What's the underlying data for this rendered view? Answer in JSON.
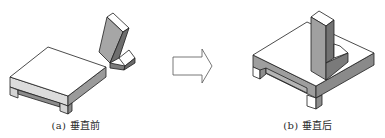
{
  "figure": {
    "panels": [
      {
        "id": "a",
        "caption": "(a) 垂直前",
        "description": "base plate and separate L-bracket before perpendicular constraint"
      },
      {
        "id": "b",
        "caption": "(b) 垂直后",
        "description": "L-bracket standing perpendicular on base plate after constraint"
      }
    ],
    "arrow": {
      "direction": "right",
      "style": "outlined"
    }
  },
  "colors": {
    "stroke": "#1e1e1e",
    "face_top": "#ffffff",
    "face_side_light": "#d9d9d9",
    "face_side_mid": "#a8a8a8",
    "face_side_dark": "#7a7a7a"
  }
}
